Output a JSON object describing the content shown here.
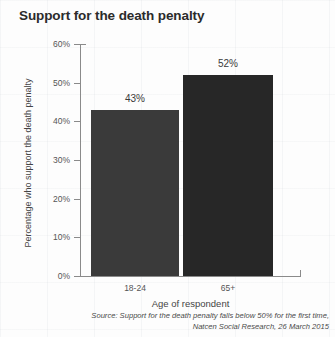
{
  "chart_data": {
    "type": "bar",
    "title": "Support for the death penalty",
    "xlabel": "Age of respondent",
    "ylabel": "Percentage who support the death penalty",
    "categories": [
      "18-24",
      "65+"
    ],
    "values": [
      43,
      52
    ],
    "value_labels": [
      "43%",
      "52%"
    ],
    "ylim": [
      0,
      60
    ],
    "yticks": [
      0,
      10,
      20,
      30,
      40,
      50,
      60
    ],
    "ytick_labels": [
      "0%",
      "10%",
      "20%",
      "30%",
      "40%",
      "50%",
      "60%"
    ],
    "grid": false,
    "legend": "none",
    "bar_colors": [
      "#3a3a3a",
      "#272727"
    ],
    "axis_color": "#8a8a8a",
    "background": "#fdfdfd"
  },
  "source": {
    "line1": "Source: Support for the death penalty falls below 50% for the first time,",
    "line2": "Natcen Social Research, 26 March 2015"
  }
}
